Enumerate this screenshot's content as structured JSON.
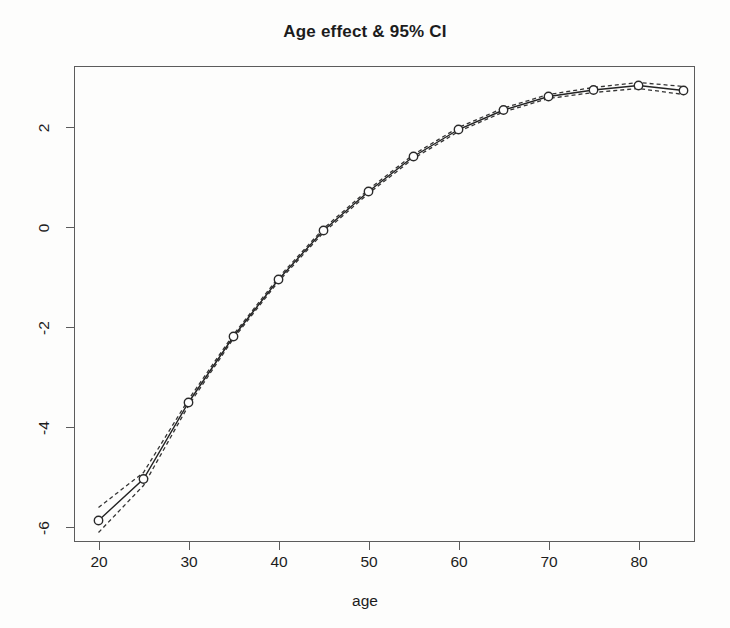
{
  "chart_data": {
    "type": "line",
    "title": "Age effect & 95% CI",
    "xlabel": "age",
    "ylabel": "",
    "xlim": [
      18.5,
      86.5
    ],
    "ylim": [
      -6.6,
      3.2
    ],
    "xticks": [
      20,
      30,
      40,
      50,
      60,
      70,
      80
    ],
    "yticks": [
      2,
      0,
      -2,
      -4,
      -6
    ],
    "grid": false,
    "legend": null,
    "x": [
      20,
      25,
      30,
      35,
      40,
      45,
      50,
      55,
      60,
      65,
      70,
      75,
      80,
      85
    ],
    "series": [
      {
        "name": "Age effect (fit)",
        "style": "solid-with-open-circle-markers",
        "values": [
          -5.88,
          -5.05,
          -3.52,
          -2.2,
          -1.06,
          -0.08,
          0.7,
          1.4,
          1.94,
          2.33,
          2.6,
          2.73,
          2.82,
          2.72
        ]
      },
      {
        "name": "95% CI upper",
        "style": "dashed",
        "values": [
          -5.62,
          -4.92,
          -3.46,
          -2.16,
          -1.02,
          -0.04,
          0.74,
          1.44,
          1.98,
          2.37,
          2.64,
          2.78,
          2.88,
          2.8
        ]
      },
      {
        "name": "95% CI lower",
        "style": "dashed",
        "values": [
          -6.12,
          -5.18,
          -3.58,
          -2.24,
          -1.1,
          -0.12,
          0.66,
          1.36,
          1.9,
          2.29,
          2.56,
          2.68,
          2.76,
          2.64
        ]
      }
    ],
    "marker": "open-circle",
    "line_color": "#2a2a2a",
    "ci_color": "#3a3a3a",
    "xtick_labels": [
      "20",
      "30",
      "40",
      "50",
      "60",
      "70",
      "80"
    ],
    "ytick_labels": [
      "2",
      "0",
      "-2",
      "-4",
      "-6"
    ]
  }
}
